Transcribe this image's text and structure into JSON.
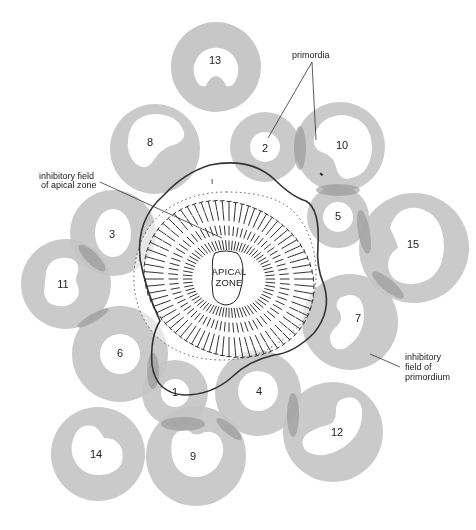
{
  "diagram": {
    "colors": {
      "field": "#c4c4c4",
      "field_overlap": "#9a9a9a",
      "outline": "#333333",
      "text": "#222222",
      "background": "#ffffff"
    },
    "labels": {
      "primordia": "primordia",
      "inhibitory_field_apical_line1": "inhibitory field",
      "inhibitory_field_apical_line2": "of apical zone",
      "inhibitory_field_primordium_line1": "inhibitory",
      "inhibitory_field_primordium_line2": "field of",
      "inhibitory_field_primordium_line3": "primordium",
      "apical_line1": "APICAL",
      "apical_line2": "ZONE",
      "site_mark": "I"
    },
    "primordia": [
      {
        "id": "1",
        "label": "1",
        "cx": 175,
        "cy": 393,
        "r": 33,
        "ri": 14
      },
      {
        "id": "2",
        "label": "2",
        "cx": 265,
        "cy": 147,
        "r": 35,
        "ri": 15
      },
      {
        "id": "3",
        "label": "3",
        "cx": 113,
        "cy": 233,
        "r": 43,
        "ri": 22
      },
      {
        "id": "4",
        "label": "4",
        "cx": 258,
        "cy": 393,
        "r": 43,
        "ri": 20
      },
      {
        "id": "5",
        "label": "5",
        "cx": 338,
        "cy": 217,
        "r": 31,
        "ri": 15
      },
      {
        "id": "6",
        "label": "6",
        "cx": 120,
        "cy": 354,
        "r": 48,
        "ri": 20
      },
      {
        "id": "7",
        "label": "7",
        "cx": 350,
        "cy": 322,
        "r": 48,
        "ri": 24
      },
      {
        "id": "8",
        "label": "8",
        "cx": 155,
        "cy": 149,
        "r": 45,
        "ri": 27
      },
      {
        "id": "9",
        "label": "9",
        "cx": 196,
        "cy": 456,
        "r": 50,
        "ri": 27
      },
      {
        "id": "10",
        "label": "10",
        "cx": 340,
        "cy": 147,
        "r": 45,
        "ri": 30
      },
      {
        "id": "11",
        "label": "11",
        "cx": 66,
        "cy": 284,
        "r": 45,
        "ri": 25
      },
      {
        "id": "12",
        "label": "12",
        "cx": 333,
        "cy": 432,
        "r": 50,
        "ri": 28
      },
      {
        "id": "13",
        "label": "13",
        "cx": 216,
        "cy": 67,
        "r": 45,
        "ri": 28
      },
      {
        "id": "14",
        "label": "14",
        "cx": 98,
        "cy": 454,
        "r": 47,
        "ri": 28
      },
      {
        "id": "15",
        "label": "15",
        "cx": 414,
        "cy": 248,
        "r": 55,
        "ri": 35
      }
    ]
  }
}
